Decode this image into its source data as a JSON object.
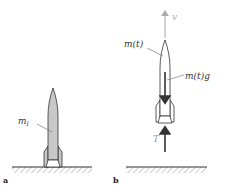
{
  "figure": {
    "panels": [
      {
        "id": "a",
        "label": "a",
        "mass_label": "m",
        "mass_subscript": "I"
      },
      {
        "id": "b",
        "label": "b",
        "velocity_label": "v",
        "mass_label": "m(t)",
        "weight_label": "m(t)g",
        "thrust_label": "T"
      }
    ],
    "colors": {
      "rocket_fill": "#c8c8c8",
      "outline": "#333333",
      "velocity_arrow": "#aaaaaa",
      "force_arrow": "#333333",
      "ground_hatch": "#999999"
    }
  }
}
